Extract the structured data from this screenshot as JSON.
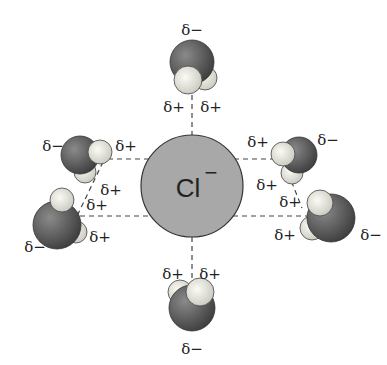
{
  "diagram": {
    "ion": {
      "label": "Cl",
      "charge": "−",
      "fill": "#a8a8a8"
    },
    "colors": {
      "oxygen": "#555555",
      "hydrogen": "#e8e8e0",
      "dash": "#444444"
    },
    "labels": {
      "top_neg": "δ−",
      "top_pos_left": "δ+",
      "top_pos_right": "δ+",
      "lt_neg": "δ−",
      "lt_pos_a": "δ+",
      "lt_pos_b": "δ+",
      "lb_pos_a": "δ+",
      "lb_pos_b": "δ+",
      "lb_neg": "δ−",
      "rt_pos_a": "δ+",
      "rt_neg": "δ−",
      "rt_pos_b": "δ+",
      "rb_pos_a": "δ+",
      "rb_pos_b": "δ+",
      "rb_neg": "δ−",
      "bot_pos_left": "δ+",
      "bot_pos_right": "δ+",
      "bot_neg": "δ−"
    }
  }
}
